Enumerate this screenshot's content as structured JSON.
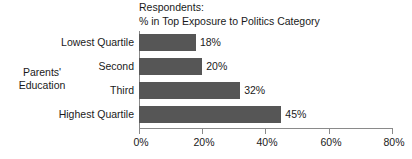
{
  "chart_data": {
    "type": "bar",
    "orientation": "horizontal",
    "title": "Respondents:\n% in Top Exposure to Politics Category",
    "title_lines": [
      "Respondents:",
      "% in Top Exposure to Politics Category"
    ],
    "xlabel": "",
    "ylabel": "Parents' Education",
    "ylabel_lines": [
      "Parents'",
      "Education"
    ],
    "categories": [
      "Lowest Quartile",
      "Second",
      "Third",
      "Highest Quartile"
    ],
    "values": [
      18,
      20,
      32,
      45
    ],
    "value_labels": [
      "18%",
      "20%",
      "32%",
      "45%"
    ],
    "xlim": [
      0,
      80
    ],
    "xticks": [
      0,
      20,
      40,
      60,
      80
    ],
    "xtick_labels": [
      "0%",
      "20%",
      "40%",
      "60%",
      "80%"
    ],
    "grid": false,
    "legend": false,
    "bar_color": "#565656",
    "axis_color": "#8a8a8a",
    "text_color": "#1a1a1a",
    "background": "#ffffff"
  }
}
